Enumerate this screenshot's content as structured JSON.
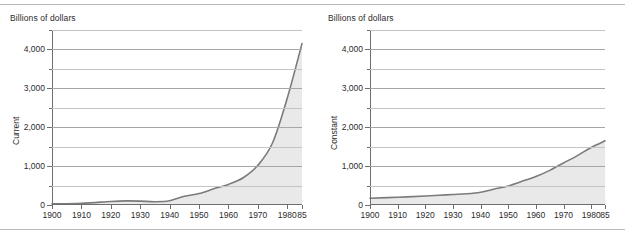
{
  "figure": {
    "unit_label": "Billions of dollars",
    "top_rule": "divider",
    "bottom_rule": "divider"
  },
  "colors": {
    "line": "#7b7b7b",
    "fill": "#e9e9e9",
    "axis": "#6e6e6e",
    "grid_major": "#a6a6a6",
    "grid_minor": "#c4c4c4",
    "text": "#2b2b2b"
  },
  "chart_data": [
    {
      "type": "area",
      "title": "",
      "name": "Current",
      "xlabel": "",
      "ylabel": "Current",
      "unit_label": "Billions of dollars",
      "grid": true,
      "legend": "none",
      "xlim": [
        1900,
        1985
      ],
      "ylim": [
        0,
        4500
      ],
      "ytick_labels": [
        "0",
        "1,000",
        "2,000",
        "3,000",
        "4,000"
      ],
      "ytick_values": [
        0,
        1000,
        2000,
        3000,
        4000
      ],
      "yminor_values": [
        500,
        1500,
        2500,
        3500,
        4500
      ],
      "xtick_labels": [
        "1900",
        "1910",
        "1920",
        "1930",
        "1940",
        "1950",
        "1960",
        "1970",
        "1980",
        "85"
      ],
      "xtick_values": [
        1900,
        1910,
        1920,
        1930,
        1940,
        1950,
        1960,
        1970,
        1980,
        1985
      ],
      "x": [
        1900,
        1910,
        1920,
        1925,
        1930,
        1935,
        1940,
        1945,
        1950,
        1955,
        1960,
        1965,
        1970,
        1975,
        1980,
        1985
      ],
      "values": [
        30,
        45,
        90,
        105,
        100,
        85,
        110,
        225,
        295,
        415,
        530,
        700,
        1020,
        1600,
        2750,
        4150
      ]
    },
    {
      "type": "area",
      "title": "",
      "name": "Constant",
      "xlabel": "",
      "ylabel": "Constant",
      "unit_label": "Billions of dollars",
      "grid": true,
      "legend": "none",
      "xlim": [
        1900,
        1985
      ],
      "ylim": [
        0,
        4500
      ],
      "ytick_labels": [
        "0",
        "1,000",
        "2,000",
        "3,000",
        "4,000"
      ],
      "ytick_values": [
        0,
        1000,
        2000,
        3000,
        4000
      ],
      "yminor_values": [
        500,
        1500,
        2500,
        3500,
        4500
      ],
      "xtick_labels": [
        "1900",
        "1910",
        "1920",
        "1930",
        "1940",
        "1950",
        "1960",
        "1970",
        "1980",
        "85"
      ],
      "xtick_values": [
        1900,
        1910,
        1920,
        1930,
        1940,
        1950,
        1960,
        1970,
        1980,
        1985
      ],
      "x": [
        1900,
        1910,
        1920,
        1925,
        1930,
        1935,
        1940,
        1945,
        1950,
        1955,
        1960,
        1965,
        1970,
        1975,
        1980,
        1985
      ],
      "values": [
        175,
        200,
        230,
        250,
        270,
        290,
        330,
        410,
        490,
        610,
        730,
        890,
        1080,
        1270,
        1480,
        1650
      ]
    }
  ]
}
